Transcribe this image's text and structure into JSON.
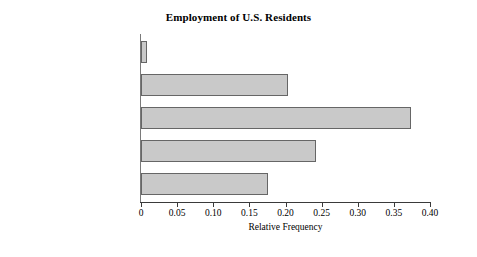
{
  "chart_data": {
    "type": "bar",
    "orientation": "horizontal",
    "title": "Employment of U.S. Residents",
    "xlabel": "Relative Frequency",
    "ylabel": "",
    "xlim": [
      0,
      0.4
    ],
    "grid": false,
    "legend": null,
    "categories": [
      "Farming, forestry, fishing",
      "Manufacturing, extraction,\ntransportation, and crafts",
      "Managerial, professional,\nand technical",
      "Sales and office",
      "Other services"
    ],
    "values": [
      0.008,
      0.203,
      0.374,
      0.242,
      0.176
    ],
    "xticks": [
      0,
      0.05,
      0.1,
      0.15,
      0.2,
      0.25,
      0.3,
      0.35,
      0.4
    ],
    "xtick_labels": [
      "0",
      "0.05",
      "0.10",
      "0.15",
      "0.20",
      "0.25",
      "0.30",
      "0.35",
      "0.40"
    ],
    "bar_fill_color": "#c9c9c9",
    "bar_edge_color": "#666666",
    "axis_color": "#3a3a3a",
    "background_color": "#ffffff"
  }
}
